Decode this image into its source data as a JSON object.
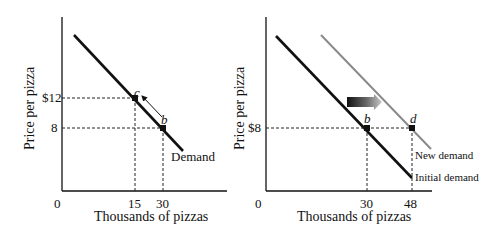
{
  "panels": [
    {
      "id": "left",
      "y_axis_label": "Price per pizza",
      "x_axis_label": "Thousands of pizzas",
      "origin_label": "0",
      "y_ticks": [
        "$12",
        "8"
      ],
      "x_ticks": [
        "15",
        "30"
      ],
      "curve_label": "Demand",
      "points": [
        {
          "label": "c",
          "quantity": 15,
          "price": 12
        },
        {
          "label": "b",
          "quantity": 30,
          "price": 8
        }
      ],
      "movement": "along curve from b to c"
    },
    {
      "id": "right",
      "y_axis_label": "Price per pizza",
      "x_axis_label": "Thousands of pizzas",
      "origin_label": "0",
      "y_ticks": [
        "$8"
      ],
      "x_ticks": [
        "30",
        "48"
      ],
      "curve_labels": [
        "New demand",
        "Initial demand"
      ],
      "points": [
        {
          "label": "b",
          "quantity": 30,
          "price": 8
        },
        {
          "label": "d",
          "quantity": 48,
          "price": 8
        }
      ],
      "movement": "shift right of demand curve"
    }
  ],
  "colors": {
    "axis": "#111111",
    "demand": "#111111",
    "new_demand": "#8a8a8a",
    "guide": "#222222"
  }
}
